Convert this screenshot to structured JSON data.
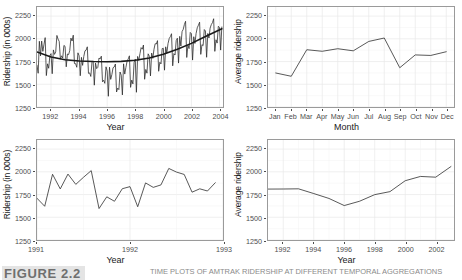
{
  "caption": {
    "label": "FIGURE 2.2",
    "text": "TIME PLOTS OF AMTRAK RIDERSHIP AT DIFFERENT TEMPORAL AGGREGATIONS"
  },
  "chart_data": [
    {
      "id": "monthly-full",
      "type": "line",
      "title": "",
      "xlabel": "Year",
      "ylabel": "Ridership (in 000s)",
      "xlim": [
        1991.0,
        2004.25
      ],
      "ylim": [
        1250,
        2350
      ],
      "xticks": [
        1992,
        1994,
        1996,
        1998,
        2000,
        2002,
        2004
      ],
      "yticks": [
        1250,
        1500,
        1750,
        2000,
        2250
      ],
      "grid": true,
      "legend": "none",
      "series": [
        {
          "name": "Monthly ridership",
          "x": [
            1991.0,
            1991.083,
            1991.167,
            1991.25,
            1991.333,
            1991.417,
            1991.5,
            1991.583,
            1991.667,
            1991.75,
            1991.833,
            1991.917,
            1992.0,
            1992.083,
            1992.167,
            1992.25,
            1992.333,
            1992.417,
            1992.5,
            1992.583,
            1992.667,
            1992.75,
            1992.833,
            1992.917,
            1993.0,
            1993.083,
            1993.167,
            1993.25,
            1993.333,
            1993.417,
            1993.5,
            1993.583,
            1993.667,
            1993.75,
            1993.833,
            1993.917,
            1994.0,
            1994.083,
            1994.167,
            1994.25,
            1994.333,
            1994.417,
            1994.5,
            1994.583,
            1994.667,
            1994.75,
            1994.833,
            1994.917,
            1995.0,
            1995.083,
            1995.167,
            1995.25,
            1995.333,
            1995.417,
            1995.5,
            1995.583,
            1995.667,
            1995.75,
            1995.833,
            1995.917,
            1996.0,
            1996.083,
            1996.167,
            1996.25,
            1996.333,
            1996.417,
            1996.5,
            1996.583,
            1996.667,
            1996.75,
            1996.833,
            1996.917,
            1997.0,
            1997.083,
            1997.167,
            1997.25,
            1997.333,
            1997.417,
            1997.5,
            1997.583,
            1997.667,
            1997.75,
            1997.833,
            1997.917,
            1998.0,
            1998.083,
            1998.167,
            1998.25,
            1998.333,
            1998.417,
            1998.5,
            1998.583,
            1998.667,
            1998.75,
            1998.833,
            1998.917,
            1999.0,
            1999.083,
            1999.167,
            1999.25,
            1999.333,
            1999.417,
            1999.5,
            1999.583,
            1999.667,
            1999.75,
            1999.833,
            1999.917,
            2000.0,
            2000.083,
            2000.167,
            2000.25,
            2000.333,
            2000.417,
            2000.5,
            2000.583,
            2000.667,
            2000.75,
            2000.833,
            2000.917,
            2001.0,
            2001.083,
            2001.167,
            2001.25,
            2001.333,
            2001.417,
            2001.5,
            2001.583,
            2001.667,
            2001.75,
            2001.833,
            2001.917,
            2002.0,
            2002.083,
            2002.167,
            2002.25,
            2002.333,
            2002.417,
            2002.5,
            2002.583,
            2002.667,
            2002.75,
            2002.833,
            2002.917,
            2003.0,
            2003.083,
            2003.167,
            2003.25,
            2003.333,
            2003.417,
            2003.5,
            2003.583,
            2003.667,
            2003.75,
            2003.833,
            2003.917,
            2004.0,
            2004.083,
            2004.167
          ],
          "y": [
            1709,
            1621,
            1973,
            1812,
            1975,
            1862,
            1940,
            2013,
            1596,
            1725,
            1676,
            1814,
            1837,
            1616,
            1878,
            1829,
            1856,
            2037,
            1997,
            1971,
            1776,
            1813,
            1789,
            1927,
            1917,
            1692,
            1833,
            1826,
            1871,
            2008,
            1976,
            2040,
            1728,
            1727,
            1687,
            1846,
            1813,
            1594,
            1796,
            1708,
            1806,
            1867,
            1876,
            1912,
            1620,
            1625,
            1586,
            1742,
            1757,
            1490,
            1733,
            1672,
            1686,
            1789,
            1779,
            1809,
            1527,
            1544,
            1510,
            1692,
            1645,
            1368,
            1688,
            1554,
            1607,
            1682,
            1690,
            1723,
            1415,
            1458,
            1441,
            1635,
            1600,
            1383,
            1725,
            1612,
            1685,
            1754,
            1779,
            1813,
            1466,
            1546,
            1504,
            1740,
            1777,
            1412,
            1806,
            1762,
            1836,
            1903,
            1886,
            1932,
            1555,
            1663,
            1622,
            1835,
            1809,
            1592,
            1843,
            1785,
            1884,
            1946,
            1943,
            1980,
            1643,
            1742,
            1724,
            1893,
            1896,
            1655,
            1912,
            1844,
            1947,
            2003,
            2024,
            2056,
            1703,
            1837,
            1822,
            1981,
            2007,
            1733,
            2027,
            1920,
            2079,
            2104,
            2158,
            2193,
            1795,
            1930,
            1892,
            2070,
            2057,
            1766,
            2023,
            1949,
            2058,
            2122,
            2150,
            2183,
            1829,
            1936,
            1925,
            2102,
            2086,
            1797,
            2059,
            2009,
            2118,
            2156,
            2179,
            2221,
            1862,
            1990,
            1953,
            2138,
            2125,
            1876,
            2130
          ],
          "color": "#2b2b2b"
        },
        {
          "name": "Quadratic trend (loess)",
          "x": [
            1991.0,
            1992.0,
            1993.0,
            1994.0,
            1995.0,
            1996.0,
            1997.0,
            1998.0,
            1999.0,
            2000.0,
            2001.0,
            2002.0,
            2003.0,
            2004.17
          ],
          "y": [
            1855,
            1800,
            1770,
            1756,
            1750,
            1748,
            1752,
            1764,
            1790,
            1830,
            1885,
            1950,
            2025,
            2110
          ],
          "color": "#1a1a1a"
        }
      ]
    },
    {
      "id": "average-by-month",
      "type": "line",
      "title": "",
      "xlabel": "Month",
      "ylabel": "Average ridership",
      "categories": [
        "Jan",
        "Feb",
        "Mar",
        "Apr",
        "May",
        "Jun",
        "Jul",
        "Aug",
        "Sep",
        "Oct",
        "Nov",
        "Dec"
      ],
      "ylim": [
        1250,
        2350
      ],
      "yticks": [
        1250,
        1500,
        1750,
        2000,
        2250
      ],
      "grid": true,
      "legend": "none",
      "values": [
        1624,
        1588,
        1880,
        1863,
        1891,
        1868,
        1971,
        2009,
        1682,
        1823,
        1817,
        1858
      ],
      "color": "#2b2b2b"
    },
    {
      "id": "monthly-zoom-1991-1993",
      "type": "line",
      "title": "",
      "xlabel": "Year",
      "ylabel": "Ridership (in 000s)",
      "xlim": [
        1991.0,
        1993.0
      ],
      "ylim": [
        1250,
        2350
      ],
      "xticks": [
        1991,
        1992,
        1993
      ],
      "yticks": [
        1250,
        1500,
        1750,
        2000,
        2250
      ],
      "grid": true,
      "legend": "none",
      "series": [
        {
          "name": "Monthly ridership",
          "x": [
            1991.0,
            1991.083,
            1991.167,
            1991.25,
            1991.333,
            1991.417,
            1991.5,
            1991.583,
            1991.667,
            1991.75,
            1991.833,
            1991.917,
            1992.0,
            1992.083,
            1992.167,
            1992.25,
            1992.333,
            1992.417,
            1992.5,
            1992.583,
            1992.667,
            1992.75,
            1992.833,
            1992.917
          ],
          "y": [
            1709,
            1621,
            1973,
            1812,
            1975,
            1862,
            1940,
            2013,
            1596,
            1725,
            1676,
            1814,
            1837,
            1616,
            1878,
            1829,
            1856,
            2037,
            1997,
            1971,
            1776,
            1813,
            1789,
            1880
          ],
          "color": "#2b2b2b"
        }
      ]
    },
    {
      "id": "average-by-year",
      "type": "line",
      "title": "",
      "xlabel": "Year",
      "ylabel": "Average ridership",
      "xlim": [
        1991,
        2003.2
      ],
      "ylim": [
        1250,
        2350
      ],
      "xticks": [
        1992,
        1994,
        1996,
        1998,
        2000,
        2002
      ],
      "yticks": [
        1250,
        1500,
        1750,
        2000,
        2250
      ],
      "grid": true,
      "legend": "none",
      "series": [
        {
          "name": "Average yearly ridership",
          "x": [
            1991,
            1992,
            1993,
            1994,
            1995,
            1996,
            1997,
            1998,
            1999,
            2000,
            2001,
            2002,
            2003
          ],
          "y": [
            1810,
            1811,
            1813,
            1761,
            1707,
            1629,
            1676,
            1749,
            1782,
            1902,
            1949,
            1941,
            2058
          ],
          "color": "#2b2b2b"
        }
      ]
    }
  ]
}
